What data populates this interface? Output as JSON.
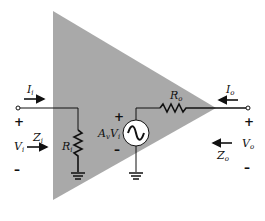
{
  "diagram": {
    "colors": {
      "triangle_fill": "#a9a9a9",
      "wire": "#111111",
      "background": "#ffffff"
    },
    "input": {
      "current_label": "I",
      "current_sub": "i",
      "voltage_label": "V",
      "voltage_sub": "i",
      "impedance_label": "Z",
      "impedance_sub": "i",
      "plus": "+",
      "minus": "–"
    },
    "input_resistor": {
      "label": "R",
      "sub": "i"
    },
    "source": {
      "gain_label": "A",
      "gain_sub": "v",
      "var_label": "V",
      "var_sub": "i",
      "plus": "+",
      "minus": "–",
      "icon": "ac-source-icon"
    },
    "output_resistor": {
      "label": "R",
      "sub": "o"
    },
    "output": {
      "current_label": "I",
      "current_sub": "o",
      "voltage_label": "V",
      "voltage_sub": "o",
      "impedance_label": "Z",
      "impedance_sub": "o",
      "plus": "+",
      "minus": "–"
    }
  }
}
